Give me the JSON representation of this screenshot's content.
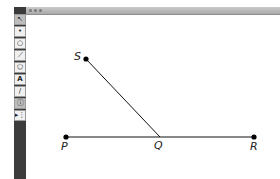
{
  "window": {
    "title_bar": {
      "buttons": [
        "close",
        "minimize",
        "zoom"
      ]
    }
  },
  "toolbar": {
    "tools": [
      {
        "name": "select-tool",
        "glyph": "↖"
      },
      {
        "name": "point-tool",
        "glyph": "•"
      },
      {
        "name": "circle-tool",
        "glyph": "○"
      },
      {
        "name": "line-tool",
        "glyph": "⟋"
      },
      {
        "name": "polygon-tool",
        "glyph": "⬠"
      },
      {
        "name": "text-tool",
        "glyph": "A"
      },
      {
        "name": "marker-tool",
        "glyph": "/"
      },
      {
        "name": "info-tool",
        "glyph": "ⓘ"
      },
      {
        "name": "custom-tool",
        "glyph": "▸⋮"
      }
    ]
  },
  "diagram": {
    "points": [
      {
        "id": "S",
        "label": "S",
        "x": 86,
        "y": 59
      },
      {
        "id": "P",
        "label": "P",
        "x": 66,
        "y": 137
      },
      {
        "id": "R",
        "label": "R",
        "x": 254,
        "y": 137
      }
    ],
    "segments": [
      {
        "from": "P",
        "to": "R"
      },
      {
        "from": "S",
        "to": "Q"
      }
    ],
    "q_point": {
      "label": "Q",
      "x": 160,
      "y": 137
    },
    "labels": {
      "S": "S",
      "P": "P",
      "Q": "Q",
      "R": "R"
    }
  }
}
